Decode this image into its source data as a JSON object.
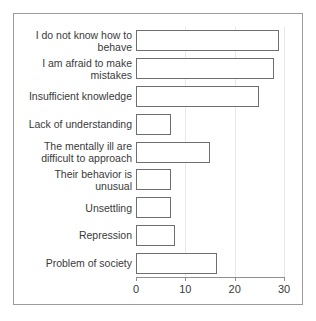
{
  "chart_data": {
    "type": "bar",
    "orientation": "horizontal",
    "title": "",
    "subtitle": "",
    "xlabel": "",
    "ylabel": "",
    "categories": [
      "I do not know how to behave",
      "I am afraid to make mistakes",
      "Insufficient knowledge",
      "Lack of understanding",
      "The mentally ill are difficult to approach",
      "Their behavior is unusual",
      "Unsettling",
      "Repression",
      "Problem of society"
    ],
    "values": [
      29,
      28,
      25,
      7,
      15,
      7,
      7,
      8,
      16.5
    ],
    "xlim": [
      0,
      30
    ],
    "xticks": [
      0,
      10,
      20,
      30
    ],
    "xtick_labels": [
      "0",
      "10",
      "20",
      "30"
    ],
    "grid": true,
    "grid_axis": "x",
    "legend": "none",
    "bar_fill": "#ffffff",
    "bar_edge": "#6e6e6e",
    "axis_color": "#8f8f8f",
    "grid_color": "#e8e8e8",
    "text_color": "#3a3a3a",
    "frame_color": "#9b9b9b",
    "background": "#ffffff"
  }
}
